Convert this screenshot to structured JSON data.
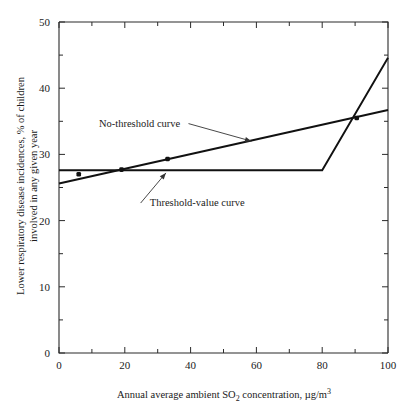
{
  "figure": {
    "background": "#ffffff",
    "ink_color": "#111111"
  },
  "chart_data": {
    "type": "line",
    "title": "",
    "xlabel_parts": {
      "before": "Annual average ambient SO",
      "sub1": "2",
      "middle": " concentration, µg/m",
      "sup1": "3"
    },
    "xlabel": "Annual average ambient SO2 concentration, µg/m3",
    "ylabel_line1": "Lower respiratory disease incidences, % of children",
    "ylabel_line2": "involved in any given year",
    "ylabel": "Lower respiratory disease incidences, % of children involved in any given year",
    "xlim": [
      0,
      100
    ],
    "ylim": [
      0,
      50
    ],
    "x_major_ticks": [
      0,
      20,
      40,
      60,
      80,
      100
    ],
    "x_minor_ticks": [
      10,
      30,
      50,
      70,
      90
    ],
    "x_tick_labels": [
      "0",
      "20",
      "40",
      "60",
      "80",
      "100"
    ],
    "y_major_ticks": [
      0,
      10,
      20,
      30,
      40,
      50
    ],
    "y_minor_ticks": [
      5,
      15,
      25,
      35,
      45
    ],
    "y_tick_labels": [
      "0",
      "10",
      "20",
      "30",
      "40",
      "50"
    ],
    "grid": false,
    "legend_position": "inline-annotations",
    "series": [
      {
        "name": "No-threshold curve",
        "type": "line",
        "points": [
          [
            0,
            25.6
          ],
          [
            100,
            36.7
          ]
        ],
        "annotation": {
          "label": "No-threshold curve",
          "text_x": 24.5,
          "text_y": 34.2,
          "arrow_tip_x": 58.5,
          "arrow_tip_y": 32.0
        }
      },
      {
        "name": "Threshold-value curve",
        "type": "line",
        "points": [
          [
            0,
            27.6
          ],
          [
            80,
            27.6
          ],
          [
            100,
            44.6
          ]
        ],
        "annotation": {
          "label": "Threshold-value curve",
          "text_x": 42.0,
          "text_y": 22.2,
          "arrow_tip_x": 32.5,
          "arrow_tip_y": 27.2
        }
      }
    ],
    "data_points": [
      {
        "x": 6.0,
        "y": 27.0
      },
      {
        "x": 19.0,
        "y": 27.7
      },
      {
        "x": 33.0,
        "y": 29.3
      },
      {
        "x": 90.5,
        "y": 35.5
      }
    ]
  }
}
